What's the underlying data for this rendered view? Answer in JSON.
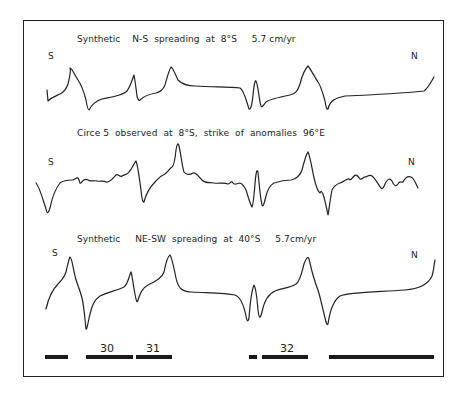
{
  "figure": {
    "profiles": [
      {
        "id": "synthetic-ns",
        "title": "Synthetic    N-S  spreading  at  8°S     5.7 cm/yr",
        "left_label": "S",
        "right_label": "N"
      },
      {
        "id": "observed-circe5",
        "title": "Circe 5  observed  at  8°S,  strike  of  anomalies  96°E",
        "left_label": "S",
        "right_label": "N"
      },
      {
        "id": "synthetic-ne-sw",
        "title": "Synthetic     NE-SW  spreading  at  40°S     5.7cm/yr",
        "left_label": "S",
        "right_label": "N"
      }
    ],
    "anomaly_bars": [
      {
        "label": "",
        "x_start": 45,
        "x_end": 68
      },
      {
        "label": "30",
        "x_start": 86,
        "x_end": 133
      },
      {
        "label": "31",
        "x_start": 136,
        "x_end": 172
      },
      {
        "label": "",
        "x_start": 249,
        "x_end": 257
      },
      {
        "label": "32",
        "x_start": 262,
        "x_end": 308
      },
      {
        "label": "",
        "x_start": 329,
        "x_end": 434
      }
    ],
    "colors": {
      "ink": "#222222",
      "background": "#ffffff"
    }
  }
}
